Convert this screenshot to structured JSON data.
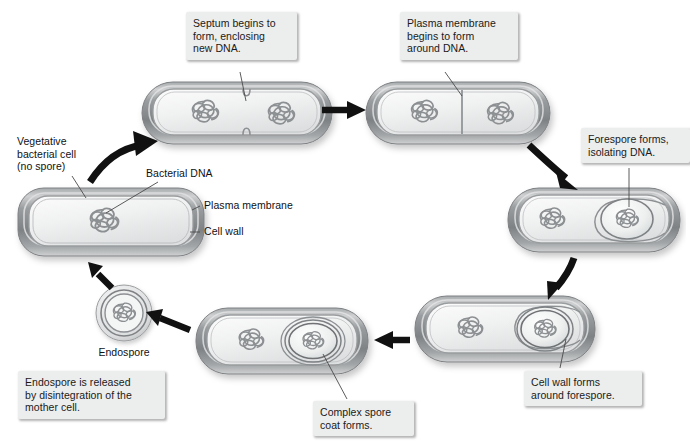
{
  "figure": {
    "background_color": "#ffffff"
  },
  "colors": {
    "cell_wall_outer": "#8f9295",
    "cell_wall_mid": "#b9bcbe",
    "cell_wall_highlight": "#e2e4e5",
    "cytoplasm": "#f2f3f3",
    "dna_stroke": "#8d9093",
    "arrow": "#111111",
    "callout_bg": "#eceded",
    "text": "#1a1a1a",
    "leader_line": "#5a5a5a"
  },
  "callouts": [
    {
      "id": "septum",
      "text": "Septum begins to\nform, enclosing\nnew DNA."
    },
    {
      "id": "plasma_form",
      "text": "Plasma membrane\nbegins to form\naround DNA."
    },
    {
      "id": "forespore",
      "text": "Forespore forms,\nisolating DNA."
    },
    {
      "id": "cellwall_fore",
      "text": "Cell wall forms\naround forespore."
    },
    {
      "id": "spore_coat",
      "text": "Complex spore\ncoat forms."
    },
    {
      "id": "released",
      "text": "Endospore is released\nby disintegration of the\nmother cell."
    }
  ],
  "labels": [
    {
      "id": "vegetative",
      "text": "Vegetative\nbacterial cell\n(no spore)"
    },
    {
      "id": "bacterial_dna",
      "text": "Bacterial DNA"
    },
    {
      "id": "plasma_membrane",
      "text": "Plasma membrane"
    },
    {
      "id": "cell_wall",
      "text": "Cell wall"
    },
    {
      "id": "endospore",
      "text": "Endospore"
    }
  ],
  "stages": [
    {
      "id": "stage-vegetative",
      "name": "vegetative-cell",
      "order": 1,
      "has_spore": false,
      "dna_count": 1
    },
    {
      "id": "stage-septum",
      "name": "septum-forming-cell",
      "order": 2,
      "has_spore": false,
      "dna_count": 2
    },
    {
      "id": "stage-membrane",
      "name": "plasma-membrane-cell",
      "order": 3,
      "has_spore": false,
      "dna_count": 2
    },
    {
      "id": "stage-forespore",
      "name": "forespore-cell",
      "order": 4,
      "has_spore": true,
      "dna_count": 2
    },
    {
      "id": "stage-cellwall",
      "name": "cell-wall-forespore-cell",
      "order": 5,
      "has_spore": true,
      "dna_count": 2
    },
    {
      "id": "stage-sporecoat",
      "name": "spore-coat-cell",
      "order": 6,
      "has_spore": true,
      "dna_count": 2
    },
    {
      "id": "stage-free-endospore",
      "name": "free-endospore",
      "order": 7,
      "has_spore": true,
      "dna_count": 1
    }
  ],
  "arrows": [
    {
      "id": "a1",
      "from": "stage-vegetative",
      "to": "stage-septum",
      "style": "curved"
    },
    {
      "id": "a2",
      "from": "stage-septum",
      "to": "stage-membrane",
      "style": "straight"
    },
    {
      "id": "a3",
      "from": "stage-membrane",
      "to": "stage-forespore",
      "style": "curved"
    },
    {
      "id": "a4",
      "from": "stage-forespore",
      "to": "stage-cellwall",
      "style": "curved"
    },
    {
      "id": "a5",
      "from": "stage-cellwall",
      "to": "stage-sporecoat",
      "style": "straight"
    },
    {
      "id": "a6",
      "from": "stage-sporecoat",
      "to": "stage-free-endospore",
      "style": "straight"
    },
    {
      "id": "a7",
      "from": "stage-free-endospore",
      "to": "stage-vegetative",
      "style": "straight"
    }
  ]
}
